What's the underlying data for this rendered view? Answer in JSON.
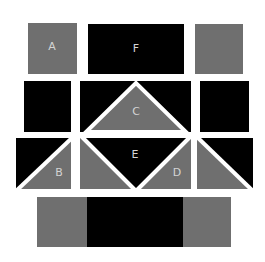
{
  "colors": {
    "background": "#ffffff",
    "gray": "#6f6f6f",
    "black": "#000000",
    "label": "#d4d4d4",
    "separator": "#ffffff"
  },
  "labels": {
    "a": "A",
    "b": "B",
    "c": "C",
    "d": "D",
    "e": "E",
    "f": "F"
  },
  "rows": [
    {
      "name": "row-1",
      "pieces": [
        "gray square A",
        "black rectangle F",
        "gray square"
      ]
    },
    {
      "name": "row-2",
      "pieces": [
        "black square",
        "black rectangle with gray triangle C",
        "black square"
      ]
    },
    {
      "name": "row-3",
      "pieces": [
        "split square B",
        "black inverted triangle E with gray sides, D",
        "split square"
      ]
    },
    {
      "name": "row-4",
      "pieces": [
        "gray block",
        "black block",
        "gray block"
      ]
    }
  ]
}
